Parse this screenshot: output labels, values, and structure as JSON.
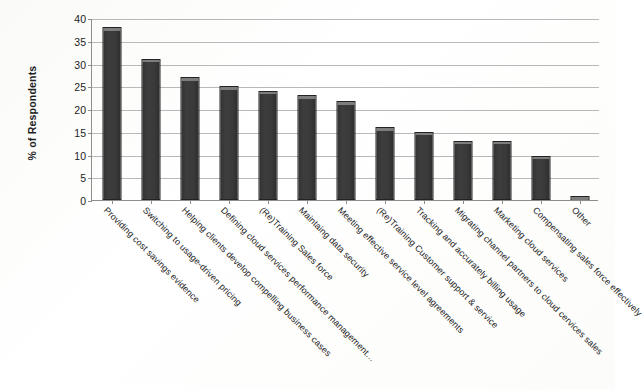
{
  "chart_data": {
    "type": "bar",
    "title": "",
    "xlabel": "",
    "ylabel": "% of Respondents",
    "ylim": [
      0,
      40
    ],
    "yticks": [
      0,
      5,
      10,
      15,
      20,
      25,
      30,
      35,
      40
    ],
    "grid": true,
    "legend": "none",
    "bar_color": "#3a3a3a",
    "gridline_color": "#b9b9b9",
    "axis_color": "#8d8d8d",
    "categories": [
      "Providing cost savings evidence",
      "Switching to usage-driven pricing",
      "Helping clients develop compelling business cases",
      "Defining cloud services performance management…",
      "(Re)Training Sales force",
      "Maintaing data security",
      "Meeting effective service level agreements",
      "(Re)Training Customer support & service",
      "Tracking and accurately billing usage",
      "Migrating channel partners to cloud cervices sales",
      "Marketing cloud services",
      "Compensating sales force effectively",
      "Other"
    ],
    "values": [
      38,
      31,
      27,
      25,
      24,
      23,
      21.7,
      16,
      15,
      13,
      13,
      9.7,
      0.8
    ]
  }
}
